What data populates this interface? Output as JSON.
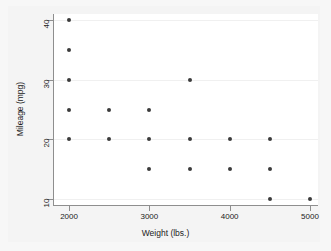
{
  "chart_data": {
    "type": "scatter",
    "title": "",
    "xlabel": "Weight (lbs.)",
    "ylabel": "Mileage (mpg)",
    "xlim": [
      1800,
      5100
    ],
    "ylim": [
      9,
      41
    ],
    "xticks": [
      2000,
      3000,
      4000,
      5000
    ],
    "xtick_labels": [
      "2000",
      "3000",
      "4000",
      "5000"
    ],
    "yticks": [
      10,
      20,
      30,
      40
    ],
    "ytick_labels": [
      "10",
      "20",
      "30",
      "40"
    ],
    "grid": true,
    "grid_axis": "y",
    "legend": "none",
    "marker": "circle",
    "marker_color": "#3b3b3b",
    "background_color": "#ffffff",
    "page_background_color": "#f4f4f4",
    "axis_color": "#8e8e8e",
    "gridline_color": "#f0f0f0",
    "points": [
      {
        "x": 2000,
        "y": 40
      },
      {
        "x": 2000,
        "y": 35
      },
      {
        "x": 2000,
        "y": 30
      },
      {
        "x": 2000,
        "y": 25
      },
      {
        "x": 2000,
        "y": 20
      },
      {
        "x": 2500,
        "y": 25
      },
      {
        "x": 2500,
        "y": 20
      },
      {
        "x": 3000,
        "y": 25
      },
      {
        "x": 3000,
        "y": 20
      },
      {
        "x": 3000,
        "y": 15
      },
      {
        "x": 3500,
        "y": 30
      },
      {
        "x": 3500,
        "y": 20
      },
      {
        "x": 3500,
        "y": 15
      },
      {
        "x": 4000,
        "y": 20
      },
      {
        "x": 4000,
        "y": 15
      },
      {
        "x": 4500,
        "y": 20
      },
      {
        "x": 4500,
        "y": 15
      },
      {
        "x": 4500,
        "y": 10
      },
      {
        "x": 5000,
        "y": 10
      }
    ]
  }
}
